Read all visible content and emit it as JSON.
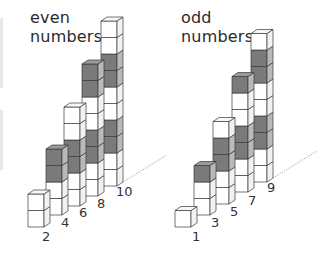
{
  "panels": [
    {
      "title_line1": "even",
      "title_line2": "numbers",
      "towers": [
        {
          "label": "2",
          "cubes": [
            "white",
            "white"
          ]
        },
        {
          "label": "4",
          "cubes": [
            "white",
            "white",
            "dark",
            "dark"
          ]
        },
        {
          "label": "6",
          "cubes": [
            "white",
            "white",
            "dark",
            "dark",
            "white",
            "white"
          ]
        },
        {
          "label": "8",
          "cubes": [
            "white",
            "white",
            "dark",
            "dark",
            "white",
            "white",
            "dark",
            "dark"
          ]
        },
        {
          "label": "10",
          "cubes": [
            "white",
            "white",
            "dark",
            "dark",
            "white",
            "white",
            "dark",
            "dark",
            "white",
            "white"
          ]
        }
      ]
    },
    {
      "title_line1": "odd",
      "title_line2": "numbers",
      "towers": [
        {
          "label": "1",
          "cubes": [
            "white"
          ]
        },
        {
          "label": "3",
          "cubes": [
            "white",
            "white",
            "dark"
          ]
        },
        {
          "label": "5",
          "cubes": [
            "white",
            "white",
            "dark",
            "dark",
            "white"
          ]
        },
        {
          "label": "7",
          "cubes": [
            "white",
            "white",
            "dark",
            "dark",
            "white",
            "white",
            "dark"
          ]
        },
        {
          "label": "9",
          "cubes": [
            "white",
            "white",
            "dark",
            "dark",
            "white",
            "white",
            "dark",
            "dark",
            "white"
          ]
        }
      ]
    }
  ],
  "colors": {
    "white_face": "#ffffff",
    "white_side": "#f2f2f2",
    "white_top": "#f7f7f7",
    "dark_face": "#7a7a7a",
    "dark_side": "#b9b9b9",
    "dark_top": "#9a9a9a",
    "outline": "#3a3a3a"
  }
}
